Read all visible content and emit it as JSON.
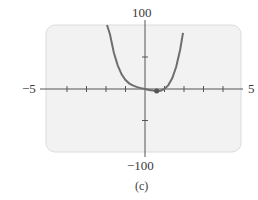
{
  "chart_data": {
    "type": "line",
    "title": "",
    "caption": "(c)",
    "xlabel": "",
    "ylabel": "",
    "xlim": [
      -5,
      5
    ],
    "ylim": [
      -100,
      100
    ],
    "x_tick_labels": {
      "min": "−5",
      "max": "5"
    },
    "y_tick_labels": {
      "min": "−100",
      "max": "100"
    },
    "x_ticks": [
      -4,
      -3,
      -2,
      -1,
      1,
      2,
      3,
      4
    ],
    "y_ticks": [
      -50,
      50
    ],
    "grid": false,
    "legend": null,
    "series": [
      {
        "name": "f(x)",
        "color": "#6e6e6e",
        "x": [
          -1.95,
          -1.8,
          -1.6,
          -1.4,
          -1.2,
          -1.0,
          -0.8,
          -0.6,
          -0.4,
          -0.2,
          0.0,
          0.2,
          0.4,
          0.6,
          0.8,
          1.0,
          1.2,
          1.4,
          1.6,
          1.8,
          1.95
        ],
        "y": [
          100,
          86,
          57,
          37,
          23,
          14,
          8.5,
          5.1,
          3.0,
          1.4,
          0.0,
          -1.4,
          -2.6,
          -3.3,
          -2.7,
          0.0,
          6.1,
          17.1,
          34.7,
          60.9,
          87.6
        ]
      }
    ],
    "annotations": [
      {
        "type": "point",
        "x": 0.6,
        "y": -3.3,
        "label": "local minimum"
      }
    ]
  },
  "labels": {
    "y_max": "100",
    "y_min": "−100",
    "x_min": "−5",
    "x_max": "5",
    "caption": "(c)"
  }
}
